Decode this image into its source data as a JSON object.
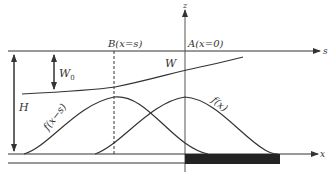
{
  "diagram": {
    "type": "physics-schematic",
    "axes": {
      "s_label": "s",
      "z_label": "z",
      "x_label": "x"
    },
    "points": {
      "B_label": "B(x=s)",
      "A_label": "A(x=0)"
    },
    "quantities": {
      "W0": "W",
      "W0_sub": "0",
      "W": "W",
      "H": "H"
    },
    "curves": {
      "shifted": "f(x−s)",
      "original": "f(x)"
    },
    "colors": {
      "line": "#333333",
      "fill": "#222222",
      "background": "#ffffff"
    }
  }
}
